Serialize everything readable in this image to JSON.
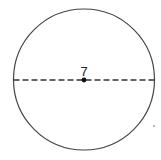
{
  "diagram": {
    "type": "circle-with-diameter",
    "circle": {
      "cx": 84,
      "cy": 79.5,
      "r": 70.5,
      "stroke": "#444444"
    },
    "diameter": {
      "style": "dashed",
      "stroke": "#333333"
    },
    "center_point": {
      "label": "7"
    },
    "stray_mark": {
      "x": 154,
      "y": 126
    }
  }
}
